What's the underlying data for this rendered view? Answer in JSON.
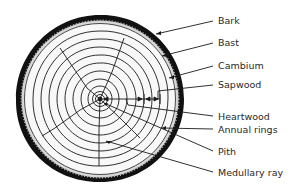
{
  "diagram": {
    "colors": {
      "bark": "#111111",
      "bast": "#e4e4e4",
      "wood": "#f7f7f7",
      "lines": "#1a1a1a",
      "text": "#2a2a2a"
    },
    "labels": [
      {
        "id": "bark",
        "text": "Bark"
      },
      {
        "id": "bast",
        "text": "Bast"
      },
      {
        "id": "cambium",
        "text": "Cambium"
      },
      {
        "id": "sapwood",
        "text": "Sapwood"
      },
      {
        "id": "heartwood",
        "text": "Heartwood"
      },
      {
        "id": "annual-rings",
        "text": "Annual rings"
      },
      {
        "id": "pith",
        "text": "Pith"
      },
      {
        "id": "medullary-ray",
        "text": "Medullary ray"
      }
    ]
  }
}
